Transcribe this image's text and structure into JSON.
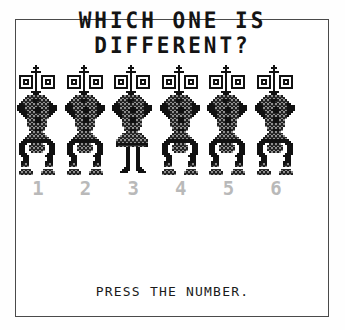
{
  "screen": {
    "background_color": "#ffffff",
    "border_color": "#4a4a4a",
    "ink_color": "#141414",
    "faded_ink_color": "#b9b9b9"
  },
  "title": {
    "line1": "WHICH ONE IS",
    "line2": "DIFFERENT?"
  },
  "puzzle": {
    "prompt": "PRESS THE NUMBER.",
    "odd_one_out": 3,
    "choice_count": 6,
    "choices": [
      {
        "number": "1",
        "variant": "standard"
      },
      {
        "number": "2",
        "variant": "standard"
      },
      {
        "number": "3",
        "variant": "thin-legs"
      },
      {
        "number": "4",
        "variant": "standard"
      },
      {
        "number": "5",
        "variant": "standard"
      },
      {
        "number": "6",
        "variant": "standard"
      }
    ]
  },
  "sprite": {
    "pixel_size": 2,
    "grid_width": 21,
    "grid_height": 55,
    "legend": {
      "0": "empty",
      "1": "solid-black",
      "2": "dither-gray"
    },
    "standard": [
      "000000000100000000000",
      "000000001110000000000",
      "000000000100000000000",
      "000000011111000000000",
      "000000000100000000000",
      "011111110100111111100",
      "010000010100100000100",
      "010111010100101110100",
      "010101010100101010100",
      "010111010100101110100",
      "010000010100100000100",
      "011111110100111111100",
      "000000000100000000000",
      "000000011111000000000",
      "000000001110000000000",
      "000002222222220000000",
      "000022222222222000000",
      "000222221112222200000",
      "002222221122222220000",
      "011222222222222211000",
      "111122222222222211110",
      "111122222111222211110",
      "111122221111122211110",
      "011112222111222211100",
      "001112222222222211000",
      "000112222222222210000",
      "000012222111222200000",
      "000002222111222000000",
      "000002222111222000000",
      "000002222222222000000",
      "000002222222222000000",
      "000000222222220000000",
      "000000222111220000000",
      "000000022222200000000",
      "000000222222220000000",
      "000002222222222000000",
      "000022222222222200000",
      "000111111111111110000",
      "001111111111111111000",
      "011110022222200111100",
      "011100222222220011100",
      "011100222222220011100",
      "011100222222220011100",
      "011100022222200011100",
      "011110000000000111100",
      "001111000000001111000",
      "000111000000000111000",
      "000111000000000111000",
      "001111000000001111000",
      "001221000000001221000",
      "002222000000002222000",
      "000000000000000000000",
      "002222200000022222000",
      "022222220000222222200",
      "022222220000222222200"
    ],
    "thin-legs": [
      "000000000100000000000",
      "000000001110000000000",
      "000000000100000000000",
      "000000011111000000000",
      "000000000100000000000",
      "011111110100111111100",
      "010000010100100000100",
      "010111010100101110100",
      "010101010100101010100",
      "010111010100101110100",
      "010000010100100000100",
      "011111110100111111100",
      "000000000100000000000",
      "000000011111000000000",
      "000000001110000000000",
      "000002222222220000000",
      "000022222222222000000",
      "000222221112222200000",
      "002222221122222220000",
      "011222222222222211000",
      "111122222222222211110",
      "111122222111222211110",
      "111122221111122211110",
      "011112222111222211100",
      "001112222222222211000",
      "000112222222222210000",
      "000012222111222200000",
      "000002222111222000000",
      "000002222111222000000",
      "000002222222222000000",
      "000002222222222000000",
      "000000222222220000000",
      "000000222111220000000",
      "000000022222200000000",
      "000002222222222000000",
      "000022222222222200000",
      "000222222222222220000",
      "002222222222222222000",
      "002222222222222222000",
      "001111111111111111000",
      "001222222222222221000",
      "000000011000110000000",
      "000000011000110000000",
      "000000011000110000000",
      "000000011000110000000",
      "000000011000110000000",
      "000000011000110000000",
      "000000011000110000000",
      "000000011000110000000",
      "000000011000110000000",
      "000000011000110000000",
      "000000111000111000000",
      "000001111000111100000",
      "000011110000011110000",
      "000000000000000000000"
    ]
  }
}
